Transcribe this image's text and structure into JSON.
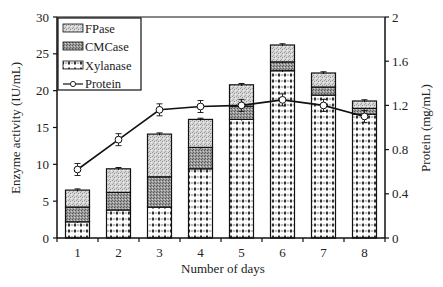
{
  "chart_data": {
    "type": "bar",
    "subtype": "stacked-bar-with-line-secondary-axis",
    "title": "",
    "xlabel": "Number of days",
    "ylabel": "Enzyme activity (IU/mL)",
    "y2label": "Protein (mg/mL)",
    "categories": [
      "1",
      "2",
      "3",
      "4",
      "5",
      "6",
      "7",
      "8"
    ],
    "ylim": [
      0,
      30
    ],
    "yticks": [
      0,
      5,
      10,
      15,
      20,
      25,
      30
    ],
    "y2lim": [
      0,
      2
    ],
    "y2ticks": [
      "0",
      "0.4",
      "0.8",
      "1.2",
      "1.6",
      "2"
    ],
    "grid": false,
    "legend_position": "upper-left-inside",
    "series": [
      {
        "name": "Xylanase",
        "kind": "stacked-bar",
        "pattern": "dots",
        "values": [
          2.2,
          3.8,
          4.2,
          9.4,
          16.1,
          22.7,
          19.4,
          16.8
        ]
      },
      {
        "name": "CMCase",
        "kind": "stacked-bar",
        "pattern": "dense-hatch",
        "values": [
          2.0,
          2.4,
          4.1,
          2.9,
          1.8,
          1.2,
          1.1,
          0.8
        ]
      },
      {
        "name": "FPase",
        "kind": "stacked-bar",
        "pattern": "light-hatch",
        "values": [
          2.3,
          3.2,
          5.8,
          3.8,
          2.9,
          2.3,
          1.9,
          1.0
        ]
      },
      {
        "name": "Protein",
        "kind": "line",
        "axis": "y2",
        "marker": "open-circle",
        "values": [
          0.62,
          0.89,
          1.16,
          1.19,
          1.2,
          1.25,
          1.2,
          1.1
        ]
      }
    ],
    "stack_totals": [
      6.5,
      9.4,
      14.1,
      16.1,
      20.8,
      26.2,
      22.4,
      18.6
    ]
  },
  "legend": {
    "items": [
      {
        "label": "FPase"
      },
      {
        "label": "CMCase"
      },
      {
        "label": "Xylanase"
      },
      {
        "label": "Protein"
      }
    ]
  },
  "axes": {
    "xlabel": "Number of days",
    "ylabel": "Enzyme activity (IU/mL)",
    "y2label": "Protein (mg/mL)"
  }
}
